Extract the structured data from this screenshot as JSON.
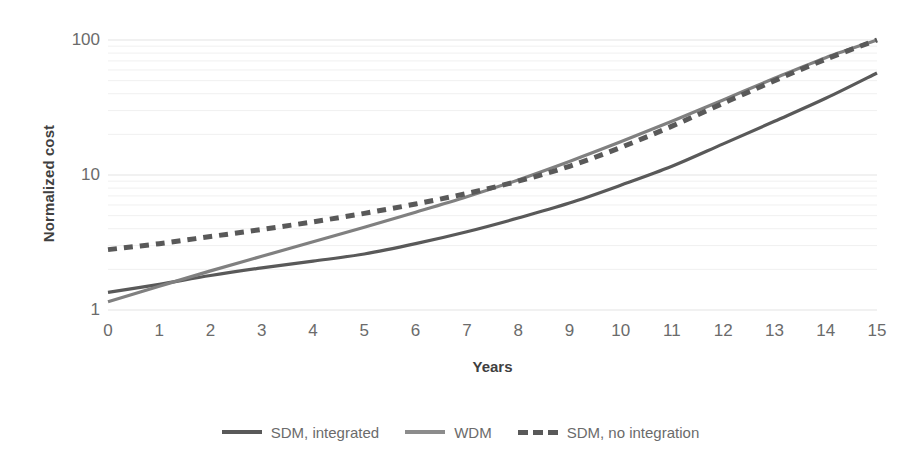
{
  "chart_data": {
    "type": "line",
    "title": "",
    "xlabel": "Years",
    "ylabel": "Normalized cost",
    "yscale": "log",
    "ylim": [
      1,
      100
    ],
    "yticks": [
      "1",
      "10",
      "100"
    ],
    "xlim": [
      0,
      15
    ],
    "xticks": [
      "0",
      "1",
      "2",
      "3",
      "4",
      "5",
      "6",
      "7",
      "8",
      "9",
      "10",
      "11",
      "12",
      "13",
      "14",
      "15"
    ],
    "grid": "horizontal-minor-log",
    "legend_position": "bottom-center",
    "x": [
      0,
      1,
      2,
      3,
      4,
      5,
      6,
      7,
      8,
      9,
      10,
      11,
      12,
      13,
      14,
      15
    ],
    "series": [
      {
        "name": "SDM, integrated",
        "color": "#595959",
        "style": "solid",
        "values": [
          1.35,
          1.55,
          1.8,
          2.05,
          2.3,
          2.6,
          3.1,
          3.8,
          4.8,
          6.2,
          8.4,
          11.6,
          17.0,
          25.0,
          37.0,
          57.0
        ]
      },
      {
        "name": "WDM",
        "color": "#808080",
        "style": "solid",
        "values": [
          1.15,
          1.5,
          1.95,
          2.5,
          3.2,
          4.1,
          5.3,
          6.9,
          9.2,
          12.6,
          17.6,
          25.0,
          36.0,
          52.0,
          74.0,
          100.0
        ]
      },
      {
        "name": "SDM, no integration",
        "color": "#595959",
        "style": "dashed",
        "values": [
          2.8,
          3.1,
          3.5,
          3.95,
          4.5,
          5.2,
          6.1,
          7.3,
          9.0,
          11.6,
          16.0,
          23.0,
          34.0,
          50.0,
          72.0,
          100.0
        ]
      }
    ]
  },
  "legend": {
    "items": [
      {
        "label": "SDM, integrated",
        "color": "#595959",
        "style": "solid"
      },
      {
        "label": "WDM",
        "color": "#8c8c8c",
        "style": "solid"
      },
      {
        "label": "SDM, no integration",
        "color": "#595959",
        "style": "dashed"
      }
    ]
  },
  "axes": {
    "y_title": "Normalized cost",
    "x_title": "Years"
  }
}
